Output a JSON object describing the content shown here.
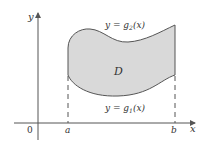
{
  "diagram": {
    "region_label": "D",
    "upper_curve_label": {
      "prefix": "y = g",
      "sub": "2",
      "suffix": "(x)"
    },
    "lower_curve_label": {
      "prefix": "y = g",
      "sub": "1",
      "suffix": "(x)"
    },
    "axes": {
      "x_label": "x",
      "y_label": "y",
      "origin_label": "0"
    },
    "ticks": {
      "a": "a",
      "b": "b"
    },
    "colors": {
      "region_fill": "#d9d9d9",
      "stroke": "#444444",
      "axis": "#555555"
    }
  }
}
